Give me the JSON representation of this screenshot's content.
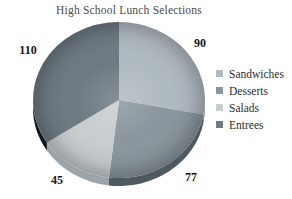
{
  "chart_data": {
    "type": "pie",
    "title": "High School Lunch Selections",
    "legend_position": "right",
    "style": "3d-pie",
    "slices": [
      {
        "label": "Sandwiches",
        "value": 90,
        "color": "#b0bac1",
        "side_color": "#7e8990"
      },
      {
        "label": "Desserts",
        "value": 77,
        "color": "#8b969e",
        "side_color": "#4f5960"
      },
      {
        "label": "Salads",
        "value": 45,
        "color": "#c8cdd0",
        "side_color": "#9aa4a9"
      },
      {
        "label": "Entrees",
        "value": 110,
        "color": "#6e7a83",
        "side_color": "#14171a"
      }
    ]
  }
}
